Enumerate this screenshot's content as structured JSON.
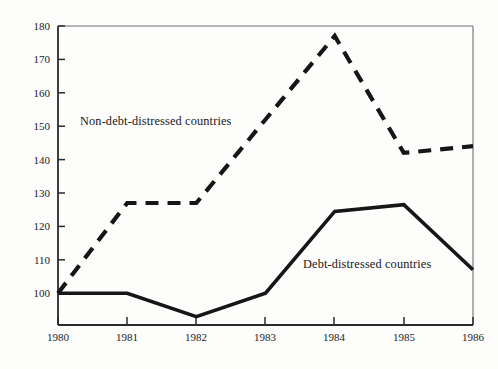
{
  "chart_data": {
    "type": "line",
    "title": "",
    "subtitle": "",
    "xlabel": "",
    "ylabel": "Index of group mean",
    "x": [
      1980,
      1981,
      1982,
      1983,
      1984,
      1985,
      1986
    ],
    "categories": [
      "1980",
      "1981",
      "1982",
      "1983",
      "1984",
      "1985",
      "1986"
    ],
    "xlim": [
      1980,
      1986
    ],
    "ylim": [
      90,
      180
    ],
    "yticks": [
      100,
      110,
      120,
      130,
      140,
      150,
      160,
      170,
      180
    ],
    "ytick_labels": [
      "100",
      "110",
      "120",
      "130",
      "140",
      "150",
      "160",
      "170",
      "180"
    ],
    "xtick_labels": [
      "1980",
      "1981",
      "1982",
      "1983",
      "1984",
      "1985",
      "1986"
    ],
    "grid": false,
    "legend_position": "inline-annotation",
    "series": [
      {
        "name": "Non-debt-distressed countries",
        "style": "dashed",
        "color": "#161616",
        "values": [
          100,
          127,
          127,
          152,
          177,
          142,
          144
        ]
      },
      {
        "name": "Debt-distressed countries",
        "style": "solid",
        "color": "#161616",
        "values": [
          100,
          100,
          93,
          100,
          124.5,
          126.5,
          107
        ]
      }
    ],
    "annotations": [
      {
        "text": "Non-debt-distressed countries",
        "x": 1980.2,
        "y": 150
      },
      {
        "text": "Debt-distressed countries",
        "x": 1983.3,
        "y": 108
      }
    ]
  },
  "axes": {
    "y_axis_title": "Index of group mean",
    "y_tick_values": [
      "180",
      "170",
      "160",
      "150",
      "140",
      "130",
      "120",
      "110",
      "100"
    ],
    "x_tick_values": [
      "1980",
      "1981",
      "1982",
      "1983",
      "1984",
      "1985",
      "1986"
    ]
  },
  "annotations": {
    "non_debt_distressed": "Non-debt-distressed countries",
    "debt_distressed": "Debt-distressed countries"
  },
  "colors": {
    "ink": "#161616",
    "axis": "#4a4a4a",
    "background": "#fdfdfc"
  }
}
